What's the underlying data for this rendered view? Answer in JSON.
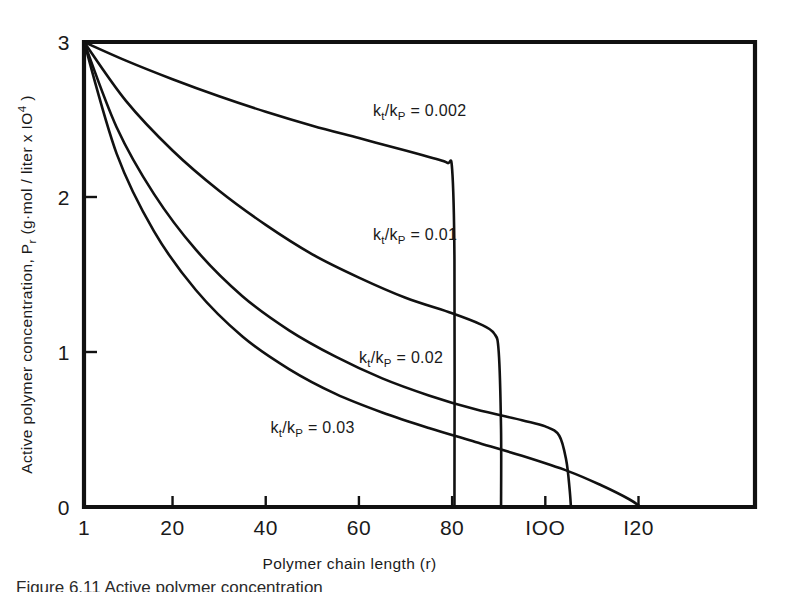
{
  "figure": {
    "background_color": "#ffffff",
    "line_color": "#111111",
    "caption_partial": "Figure 6.11  Active polymer concentration"
  },
  "chart_data": {
    "type": "line",
    "title": "",
    "xlabel": "Polymer chain length (r)",
    "ylabel_plain": "Active polymer concentration, Pr (g·mol / liter x 10⁴)",
    "ylabel_parts": {
      "lead": "Active polymer concentration, P",
      "sub": "r",
      "mid": " (g·mol / liter  x  IO",
      "sup": "4",
      "tail": " )"
    },
    "xlim": [
      1,
      145
    ],
    "ylim": [
      0,
      3
    ],
    "xticks": [
      1,
      20,
      40,
      60,
      80,
      100,
      120
    ],
    "xticklabels": [
      "1",
      "20",
      "40",
      "60",
      "80",
      "IOO",
      "I20"
    ],
    "yticks": [
      0,
      1,
      2,
      3
    ],
    "yticklabels": [
      "0",
      "1",
      "2",
      "3"
    ],
    "grid": false,
    "legend_position": "inline-annotations",
    "series": [
      {
        "name": "kt/kP = 0.002",
        "label_parts": {
          "k1": "k",
          "sub1": "t",
          "slash": "/k",
          "sub2": "P",
          "eq": " = 0.002"
        },
        "label_x": 63,
        "label_y": 2.52,
        "cutoff_r": 80,
        "points": [
          [
            1,
            3.0
          ],
          [
            10,
            2.88
          ],
          [
            20,
            2.76
          ],
          [
            30,
            2.65
          ],
          [
            40,
            2.55
          ],
          [
            50,
            2.46
          ],
          [
            60,
            2.38
          ],
          [
            70,
            2.3
          ],
          [
            76,
            2.25
          ],
          [
            79,
            2.22
          ],
          [
            80,
            2.18
          ],
          [
            80.5,
            1.6
          ],
          [
            80.5,
            0.0
          ]
        ]
      },
      {
        "name": "kt/kP = 0.01",
        "label_parts": {
          "k1": "k",
          "sub1": "t",
          "slash": "/k",
          "sub2": "P",
          "eq": " = 0.01"
        },
        "label_x": 63,
        "label_y": 1.72,
        "cutoff_r": 90,
        "points": [
          [
            1,
            3.0
          ],
          [
            10,
            2.62
          ],
          [
            20,
            2.3
          ],
          [
            30,
            2.04
          ],
          [
            40,
            1.82
          ],
          [
            50,
            1.63
          ],
          [
            60,
            1.48
          ],
          [
            70,
            1.35
          ],
          [
            80,
            1.25
          ],
          [
            86,
            1.18
          ],
          [
            89,
            1.12
          ],
          [
            90,
            1.0
          ],
          [
            90.5,
            0.5
          ],
          [
            90.5,
            0.0
          ]
        ]
      },
      {
        "name": "kt/kP = 0.02",
        "label_parts": {
          "k1": "k",
          "sub1": "t",
          "slash": "/k",
          "sub2": "P",
          "eq": " = 0.02"
        },
        "label_x": 60,
        "label_y": 0.93,
        "cutoff_r": 105,
        "points": [
          [
            1,
            3.0
          ],
          [
            8,
            2.45
          ],
          [
            16,
            2.02
          ],
          [
            25,
            1.66
          ],
          [
            35,
            1.36
          ],
          [
            45,
            1.14
          ],
          [
            55,
            0.97
          ],
          [
            65,
            0.83
          ],
          [
            75,
            0.72
          ],
          [
            85,
            0.63
          ],
          [
            95,
            0.56
          ],
          [
            100,
            0.52
          ],
          [
            103,
            0.46
          ],
          [
            104.5,
            0.3
          ],
          [
            105.2,
            0.12
          ],
          [
            105.5,
            0.0
          ]
        ]
      },
      {
        "name": "kt/kP = 0.03",
        "label_parts": {
          "k1": "k",
          "sub1": "t",
          "slash": "/k",
          "sub2": "P",
          "eq": " = 0.03"
        },
        "label_x": 41,
        "label_y": 0.48,
        "cutoff_r": 120,
        "points": [
          [
            1,
            3.0
          ],
          [
            8,
            2.28
          ],
          [
            16,
            1.78
          ],
          [
            25,
            1.4
          ],
          [
            35,
            1.1
          ],
          [
            45,
            0.89
          ],
          [
            55,
            0.73
          ],
          [
            65,
            0.61
          ],
          [
            75,
            0.51
          ],
          [
            85,
            0.42
          ],
          [
            95,
            0.33
          ],
          [
            105,
            0.23
          ],
          [
            112,
            0.14
          ],
          [
            118,
            0.05
          ],
          [
            120.5,
            0.0
          ]
        ]
      }
    ]
  }
}
